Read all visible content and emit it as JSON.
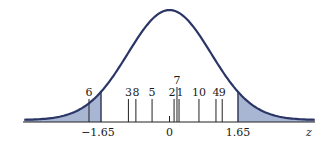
{
  "chart_data": {
    "type": "area",
    "title": "",
    "xlabel": "z",
    "ylabel": "",
    "xlim": [
      -3.5,
      3.5
    ],
    "grid": false,
    "legend": null,
    "x_ticks": [
      {
        "value": -1.65,
        "label": "−1.65"
      },
      {
        "value": 0,
        "label": "0"
      },
      {
        "value": 1.65,
        "label": "1.65"
      }
    ],
    "critical_values": [
      -1.65,
      1.65
    ],
    "shaded_regions": [
      {
        "from": -3.5,
        "to": -1.65,
        "label": "left tail"
      },
      {
        "from": 1.65,
        "to": 3.5,
        "label": "right tail"
      }
    ],
    "marks": [
      {
        "label": "6",
        "z": -1.94
      },
      {
        "label": "3",
        "z": -0.99
      },
      {
        "label": "8",
        "z": -0.81
      },
      {
        "label": "5",
        "z": -0.42
      },
      {
        "label": "2",
        "z": 0.11
      },
      {
        "label": "7",
        "z": 0.18
      },
      {
        "label": "1",
        "z": 0.23
      },
      {
        "label": "10",
        "z": 0.71
      },
      {
        "label": "4",
        "z": 1.12
      },
      {
        "label": "9",
        "z": 1.27
      }
    ],
    "colors": {
      "curve": "#2b3566",
      "shade": "#a9b6d3",
      "axis": "#222222",
      "marks": "#222222"
    }
  }
}
